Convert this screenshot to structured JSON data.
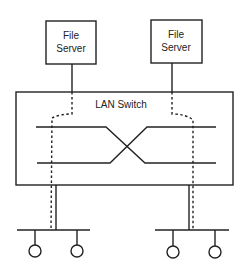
{
  "diagram": {
    "servers": [
      {
        "line1": "File",
        "line2": "Server"
      },
      {
        "line1": "File",
        "line2": "Server"
      }
    ],
    "switch": {
      "label": "LAN Switch"
    },
    "colors": {
      "stroke": "#222222",
      "background": "#ffffff"
    },
    "segments": [
      {
        "stations": 2
      },
      {
        "stations": 2
      }
    ]
  }
}
